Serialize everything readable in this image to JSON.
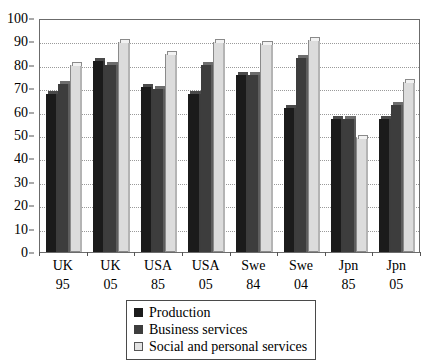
{
  "chart_data": {
    "type": "bar",
    "title": "",
    "subtitle": "",
    "xlabel": "",
    "ylabel": "",
    "ylim": [
      0,
      100
    ],
    "yticks": [
      0,
      10,
      20,
      30,
      40,
      50,
      60,
      70,
      80,
      90,
      100
    ],
    "grid": true,
    "legend_position": "bottom",
    "categories": [
      {
        "line1": "UK",
        "line2": "95"
      },
      {
        "line1": "UK",
        "line2": "05"
      },
      {
        "line1": "USA",
        "line2": "85"
      },
      {
        "line1": "USA",
        "line2": "05"
      },
      {
        "line1": "Swe",
        "line2": "84"
      },
      {
        "line1": "Swe",
        "line2": "04"
      },
      {
        "line1": "Jpn",
        "line2": "85"
      },
      {
        "line1": "Jpn",
        "line2": "05"
      }
    ],
    "category_labels": [
      "UK 95",
      "UK 05",
      "USA 85",
      "USA 05",
      "Swe 84",
      "Swe 04",
      "Jpn 85",
      "Jpn 05"
    ],
    "series": [
      {
        "name": "Production",
        "color": "#1b1b1b",
        "values": [
          69,
          83,
          72,
          69,
          77,
          63,
          58,
          58
        ]
      },
      {
        "name": "Business services",
        "color": "#3d3d3d",
        "values": [
          73,
          81,
          71,
          81,
          77,
          84,
          58,
          64
        ]
      },
      {
        "name": "Social and personal services",
        "color": "#dcdcdc",
        "values": [
          81,
          91,
          86,
          91,
          90,
          92,
          50,
          74
        ]
      }
    ]
  }
}
